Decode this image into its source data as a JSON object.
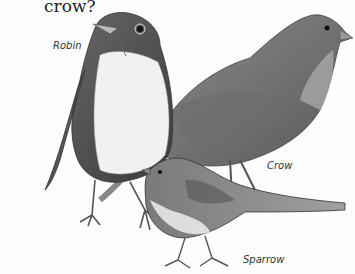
{
  "question_text": "crow?",
  "labels": {
    "robin": "Robin",
    "crow": "Crow",
    "sparrow": "Sparrow"
  },
  "illustration": {
    "subject": "pencil drawings of three birds: robin, crow, sparrow",
    "style": "grayscale pencil sketch"
  }
}
